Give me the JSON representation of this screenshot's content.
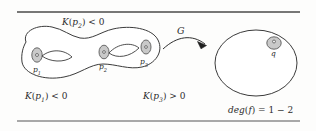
{
  "figure": {
    "kind": "math-diagram",
    "colors": {
      "ink": "#2b2b2b",
      "rule": "#4a4a4a",
      "blob_fill": "#ffffff",
      "point_fill": "#c9c9c9",
      "point_stroke": "#5a5a5a",
      "background": "#fdfdfc"
    },
    "rules": {
      "top_y": 12,
      "bottom_y": 121,
      "x_start": 17,
      "x_end": 300
    },
    "labels": {
      "curvature_top": {
        "fn": "K",
        "arg_base": "p",
        "arg_sub": "2",
        "relation": "< 0"
      },
      "curvature_left": {
        "fn": "K",
        "arg_base": "p",
        "arg_sub": "1",
        "relation": "< 0"
      },
      "curvature_right": {
        "fn": "K",
        "arg_base": "p",
        "arg_sub": "3",
        "relation": "> 0"
      },
      "map": "G",
      "degree": {
        "fn": "deg",
        "arg": "f",
        "equals": "=",
        "value": "1 − 2"
      }
    },
    "source_region": {
      "name": "dumbbell-region",
      "points": [
        {
          "id": "p1",
          "base": "p",
          "sub": "1",
          "cx": 37,
          "cy": 55,
          "rx": 5.2,
          "ry": 7.2,
          "label_x": 33,
          "label_y": 70
        },
        {
          "id": "p2",
          "base": "p",
          "sub": "2",
          "cx": 104,
          "cy": 52,
          "rx": 5.0,
          "ry": 6.8,
          "label_x": 100,
          "label_y": 67
        },
        {
          "id": "p3",
          "base": "p",
          "sub": "3",
          "cx": 146,
          "cy": 47,
          "rx": 5.0,
          "ry": 7.0,
          "label_x": 140,
          "label_y": 64
        }
      ]
    },
    "target_region": {
      "name": "target-circle",
      "point": {
        "id": "q",
        "base": "q",
        "cx": 274,
        "cy": 43,
        "rx": 7.2,
        "ry": 6.2,
        "label_x": 271,
        "label_y": 58
      }
    }
  }
}
